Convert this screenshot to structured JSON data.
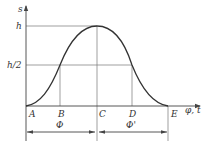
{
  "diagram": {
    "type": "cam-displacement-curve",
    "axes": {
      "y_label": "s",
      "x_label": "φ, t"
    },
    "y_ticks": [
      {
        "label": "h",
        "y": 26
      },
      {
        "label": "h/2",
        "y": 65
      }
    ],
    "x_points": [
      {
        "label": "A",
        "x": 26
      },
      {
        "label": "B",
        "x": 60
      },
      {
        "label": "C",
        "x": 97
      },
      {
        "label": "D",
        "x": 132
      },
      {
        "label": "E",
        "x": 168
      }
    ],
    "dimensions": [
      {
        "label": "Φ",
        "from": "A",
        "to": "C"
      },
      {
        "label": "Φ'",
        "from": "C",
        "to": "E"
      }
    ],
    "colors": {
      "curve": "#333333",
      "axis": "#444444",
      "guide": "#777777",
      "background": "#ffffff"
    }
  }
}
